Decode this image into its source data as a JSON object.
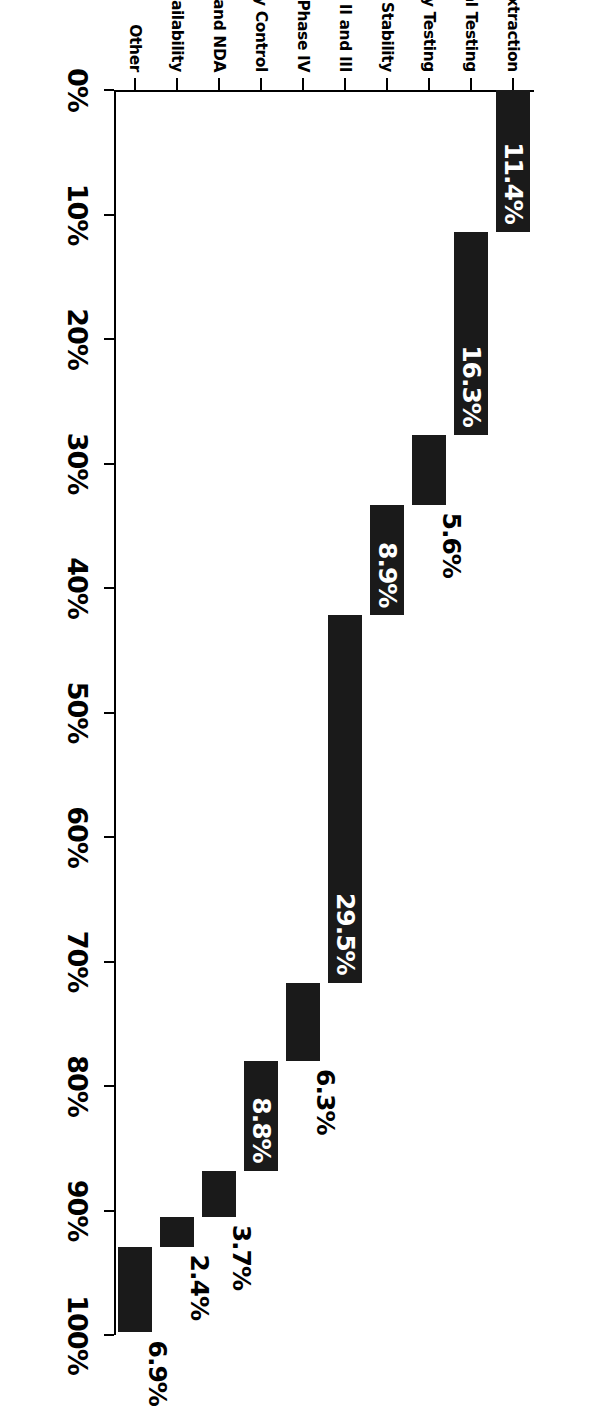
{
  "chart_data": {
    "type": "bar",
    "subtype": "waterfall-cascade-horizontal",
    "title": "",
    "subtitle": "",
    "xlabel": "",
    "ylabel": "",
    "xlim": [
      0,
      100
    ],
    "grid": false,
    "legend": null,
    "orientation": "horizontal",
    "axis_tick_suffix": "%",
    "xticks": [
      0,
      10,
      20,
      30,
      40,
      50,
      60,
      70,
      80,
      90,
      100
    ],
    "xticklabels": [
      "0%",
      "10%",
      "20%",
      "30%",
      "40%",
      "50%",
      "60%",
      "70%",
      "80%",
      "90%",
      "100%"
    ],
    "categories": [
      "Synthesis and Extraction",
      "Biological Screening and Pharmacological Testing",
      "Toxicology and Safety Testing",
      "Pharmaceutical Dosage Formulation and Stability",
      "Clinical Evaluation: Phases I, II and III",
      "Clinical Evaluation: Phase IV",
      "Process Development for Manufacturing and Quality Control",
      "Regulatory: IND and NDA",
      "Bioavailability",
      "Other"
    ],
    "values": [
      11.4,
      16.3,
      5.6,
      8.9,
      29.5,
      6.3,
      8.8,
      3.7,
      2.4,
      6.9
    ],
    "value_labels": [
      "11.4%",
      "16.3%",
      "5.6%",
      "8.9%",
      "29.5%",
      "6.3%",
      "8.8%",
      "3.7%",
      "2.4%",
      "6.9%"
    ],
    "cumulative_start": [
      0.0,
      11.4,
      27.7,
      33.3,
      42.2,
      71.7,
      78.0,
      86.8,
      90.5,
      92.9
    ],
    "cumulative_end": [
      11.4,
      27.7,
      33.3,
      42.2,
      71.7,
      78.0,
      86.8,
      90.5,
      92.9,
      99.8
    ],
    "label_placement": [
      "inside",
      "inside",
      "outside",
      "inside",
      "inside",
      "outside",
      "inside",
      "outside",
      "outside",
      "outside"
    ],
    "colors": {
      "bar": "#1a1a1a",
      "axis": "#000000",
      "background": "#ffffff",
      "label_inside": "#ffffff",
      "label_outside": "#000000"
    }
  }
}
